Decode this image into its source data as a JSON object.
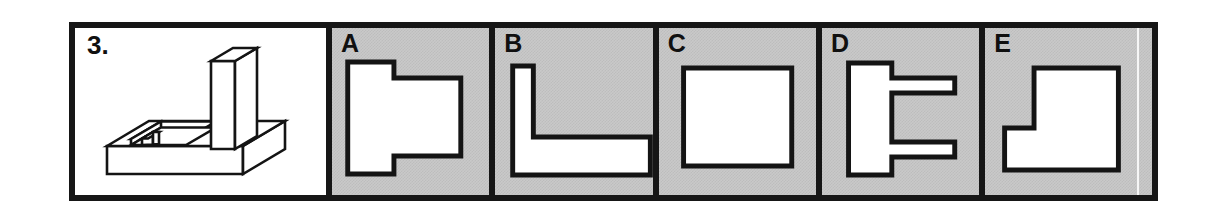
{
  "question": {
    "number_label": "3.",
    "figure_name": "isometric-pictorial-block",
    "description": "Isometric pictorial of a rectangular base plate with a tall vertical rectangular fin rising at the right and a rectangular pocket/recess cut into the top-left of the base with a small interior step."
  },
  "options": [
    {
      "id": "A",
      "label": "A",
      "shape_name": "stepped-tee-outline",
      "description": "Outline resembling a wide T laid on its side: tall narrow block at left with a wider block projecting to the right between two steps."
    },
    {
      "id": "B",
      "label": "B",
      "shape_name": "l-shape-outline",
      "description": "L shaped outline: narrow vertical leg at the left joined to a long horizontal leg along the bottom extending to the right edge."
    },
    {
      "id": "C",
      "label": "C",
      "shape_name": "plain-rectangle-outline",
      "description": "A plain rectangle outline with no internal lines."
    },
    {
      "id": "D",
      "label": "D",
      "shape_name": "double-arm-outline",
      "description": "Vertical bar at left with two thin horizontal arms projecting to the right, one near the top and one near the bottom."
    },
    {
      "id": "E",
      "label": "E",
      "shape_name": "notched-square-outline",
      "description": "Square outline with a rectangular step notch removed from the lower left corner region."
    }
  ],
  "style": {
    "frame_color": "#161616",
    "option_background": "#c9c9c9",
    "shape_fill": "#ffffff",
    "stroke_color": "#141414",
    "page_background": "#ffffff"
  }
}
